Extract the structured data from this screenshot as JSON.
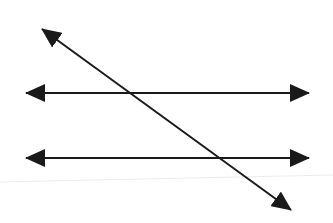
{
  "diagram": {
    "title": "Two parallel lines cut by a transversal",
    "stroke_color": "#1a1a1a",
    "background": "#ffffff",
    "faint_line_color": "#ececec",
    "lines": [
      {
        "name": "parallel-line-top",
        "x1": 26,
        "y1": 93,
        "x2": 309,
        "y2": 93,
        "arrows": "both"
      },
      {
        "name": "parallel-line-bottom",
        "x1": 26,
        "y1": 158,
        "x2": 309,
        "y2": 158,
        "arrows": "both"
      },
      {
        "name": "transversal-line",
        "x1": 42,
        "y1": 29,
        "x2": 291,
        "y2": 210,
        "arrows": "both"
      }
    ]
  }
}
